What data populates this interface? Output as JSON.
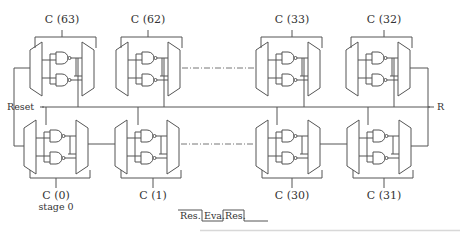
{
  "diagram": {
    "type": "ring-oscillator-chain",
    "top_row": [
      {
        "id": "c63",
        "label": "C (63)"
      },
      {
        "id": "c62",
        "label": "C (62)"
      },
      {
        "id": "c33",
        "label": "C (33)"
      },
      {
        "id": "c32",
        "label": "C (32)"
      }
    ],
    "bottom_row": [
      {
        "id": "c0",
        "label": "C (0)",
        "sublabel": "stage 0"
      },
      {
        "id": "c1",
        "label": "C (1)"
      },
      {
        "id": "c30",
        "label": "C (30)"
      },
      {
        "id": "c31",
        "label": "C (31)"
      }
    ],
    "signals": {
      "reset_label": "Reset",
      "right_label": "R"
    },
    "timing": {
      "phases": [
        "Res.",
        "Eva.",
        "Res."
      ]
    },
    "colors": {
      "line": "#555555",
      "text": "#333333",
      "background": "#ffffff"
    }
  }
}
